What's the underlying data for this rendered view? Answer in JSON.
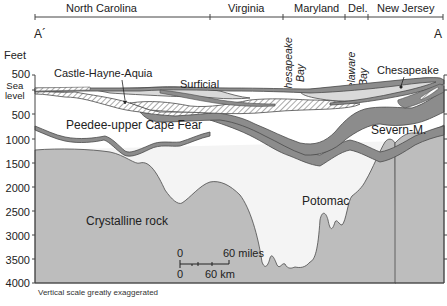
{
  "header": {
    "states": [
      {
        "label": "North Carolina",
        "x": 66
      },
      {
        "label": "Virginia",
        "x": 228
      },
      {
        "label": "Maryland",
        "x": 294
      },
      {
        "label": "Del.",
        "x": 348
      },
      {
        "label": "New Jersey",
        "x": 377
      }
    ],
    "section_start": "A´",
    "section_end": "A"
  },
  "bays": [
    {
      "label": "Chesapeake Bay",
      "line1": "Chesapeake",
      "line2": "Bay"
    },
    {
      "label": "Delaware Bay",
      "line1": "Delaware",
      "line2": "Bay"
    }
  ],
  "y_axis": {
    "unit": "Feet",
    "ticks": [
      "500",
      "Sea level",
      "500",
      "1000",
      "1500",
      "2000",
      "2500",
      "3000",
      "3500",
      "4000"
    ],
    "sea_level_line1": "Sea",
    "sea_level_line2": "level"
  },
  "units": {
    "labels": {
      "castle_hayne": "Castle-Hayne-Aquia",
      "surficial": "Surficial",
      "chesapeake": "Chesapeake",
      "peedee": "Peedee-upper Cape Fear",
      "severn": "Severn-M.",
      "potomac": "Potomac",
      "crystalline": "Crystalline rock"
    }
  },
  "scale_bar": {
    "miles_start": "0",
    "miles_end": "60 miles",
    "km_start": "0",
    "km_end": "60 km"
  },
  "footnote": "Vertical scale greatly exaggerated",
  "colors": {
    "crystalline": "#bdbdbd",
    "confining": "#8c8c8c",
    "aquifer_white": "#ffffff",
    "aquifer_light": "#d9d9d9",
    "outline": "#4a4a4a"
  }
}
